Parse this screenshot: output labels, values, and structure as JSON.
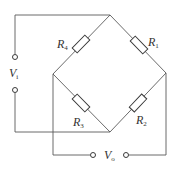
{
  "diagram": {
    "colors": {
      "wire": "#5a5a5a",
      "component": "#3a3a3a",
      "background": "#ffffff"
    },
    "resistors": [
      {
        "id": "R1",
        "symbol": "R",
        "subscript": "1",
        "branch": "top-right"
      },
      {
        "id": "R2",
        "symbol": "R",
        "subscript": "2",
        "branch": "bottom-right"
      },
      {
        "id": "R3",
        "symbol": "R",
        "subscript": "3",
        "branch": "bottom-left"
      },
      {
        "id": "R4",
        "symbol": "R",
        "subscript": "4",
        "branch": "top-left"
      }
    ],
    "input": {
      "symbol": "V",
      "subscript": "i",
      "label": "Vi"
    },
    "output": {
      "symbol": "V",
      "subscript": "o",
      "label": "Vo"
    }
  }
}
